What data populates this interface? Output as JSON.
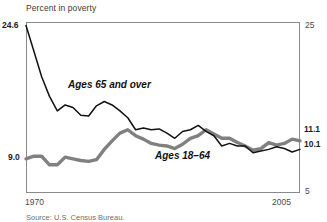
{
  "chart_data": {
    "type": "line",
    "title": "Percent in poverty",
    "xlabel": "",
    "ylabel": "Percent in poverty",
    "xlim": [
      1970,
      2005
    ],
    "ylim": [
      5,
      25
    ],
    "grid": false,
    "legend_position": "inline-annotations",
    "x_tick_labels": [
      "1970",
      "2005"
    ],
    "y_left_tick_labels": [
      "24.6",
      "9.0"
    ],
    "y_right_tick_labels": [
      "25",
      "5"
    ],
    "end_value_labels": [
      "11.1",
      "10.1"
    ],
    "x": [
      1970,
      1971,
      1972,
      1973,
      1974,
      1975,
      1976,
      1977,
      1978,
      1979,
      1980,
      1981,
      1982,
      1983,
      1984,
      1985,
      1986,
      1987,
      1988,
      1989,
      1990,
      1991,
      1992,
      1993,
      1994,
      1995,
      1996,
      1997,
      1998,
      1999,
      2000,
      2001,
      2002,
      2003,
      2004,
      2005
    ],
    "series": [
      {
        "name": "Ages 65 and over",
        "color": "#111111",
        "style": "thin-black",
        "values": [
          24.6,
          21.6,
          18.6,
          16.3,
          14.6,
          15.3,
          15.0,
          14.1,
          14.0,
          15.2,
          15.7,
          15.3,
          14.6,
          13.8,
          12.4,
          12.6,
          12.4,
          12.5,
          12.0,
          11.4,
          12.2,
          12.4,
          12.9,
          12.2,
          11.7,
          10.5,
          10.8,
          10.5,
          10.5,
          9.7,
          9.9,
          10.1,
          10.4,
          10.2,
          9.8,
          10.1
        ],
        "start_value": 24.6,
        "end_value": 10.1
      },
      {
        "name": "Ages 18-64",
        "color": "#808080",
        "style": "thick-gray",
        "values": [
          9.0,
          9.3,
          9.3,
          8.3,
          8.3,
          9.2,
          9.0,
          8.8,
          8.7,
          8.9,
          10.1,
          11.1,
          12.0,
          12.4,
          11.7,
          11.3,
          10.8,
          10.6,
          10.5,
          10.2,
          10.7,
          11.4,
          11.7,
          12.4,
          11.9,
          11.4,
          11.4,
          10.9,
          10.5,
          10.0,
          10.2,
          10.9,
          10.6,
          10.8,
          11.3,
          11.1
        ],
        "start_value": 9.0,
        "end_value": 11.1
      }
    ]
  },
  "chart": {
    "axis_title": "Percent in poverty",
    "left_top_tick": "24.6",
    "left_bottom_tick": "9.0",
    "right_top_tick": "25",
    "right_bottom_tick": "5",
    "right_label_gray": "11.1",
    "right_label_black": "10.1",
    "x_start": "1970",
    "x_end": "2005",
    "label_older": "Ages 65 and over",
    "label_younger": "Ages 18–64",
    "source": "Source: U.S. Census Bureau."
  }
}
